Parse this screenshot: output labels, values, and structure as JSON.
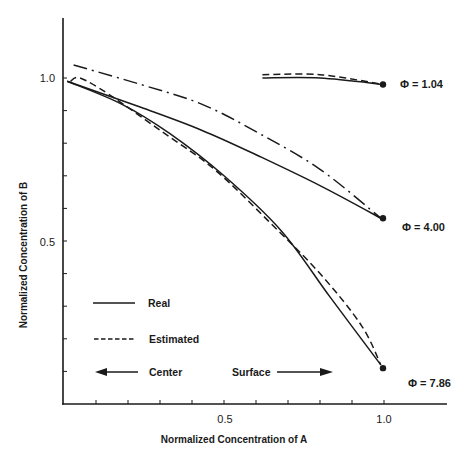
{
  "chart_data": {
    "type": "line",
    "title": "",
    "xlabel": "Normalized Concentration of A",
    "ylabel": "Normalized Concentration of B",
    "xlim": [
      0,
      1.2
    ],
    "ylim": [
      0,
      1.2
    ],
    "grid": false,
    "x_ticks": [
      0.1,
      0.2,
      0.3,
      0.4,
      0.5,
      0.6,
      0.7,
      0.8,
      0.9,
      1.0
    ],
    "x_tick_labels": {
      "0.5": "0.5",
      "1.0": "1.0"
    },
    "y_ticks": [
      0.1,
      0.2,
      0.3,
      0.4,
      0.5,
      0.6,
      0.7,
      0.8,
      0.9,
      1.0
    ],
    "y_tick_labels": {
      "0.5": "0.5",
      "1.0": "1.0"
    },
    "legend": [
      {
        "label": "Real",
        "style": "solid"
      },
      {
        "label": "Estimated",
        "style": "dashed"
      }
    ],
    "direction_annotations": [
      {
        "label": "Center",
        "arrow": "left"
      },
      {
        "label": "Surface",
        "arrow": "right"
      }
    ],
    "series": [
      {
        "name": "Real, Φ = 1.04",
        "group": "Φ = 1.04",
        "style": "solid",
        "x": [
          0.62,
          0.8,
          1.0
        ],
        "y": [
          1.0,
          1.0,
          0.98
        ]
      },
      {
        "name": "Estimated, Φ = 1.04",
        "group": "Φ = 1.04",
        "style": "dashed",
        "x": [
          0.62,
          0.8,
          1.0
        ],
        "y": [
          1.01,
          1.01,
          0.98
        ]
      },
      {
        "name": "Real, Φ = 4.00",
        "group": "Φ = 4.00",
        "style": "solid",
        "x": [
          0.01,
          0.24,
          0.43,
          0.61,
          0.8,
          0.99
        ],
        "y": [
          0.99,
          0.91,
          0.84,
          0.76,
          0.67,
          0.57
        ]
      },
      {
        "name": "Estimated, Φ = 4.00",
        "group": "Φ = 4.00",
        "style": "dashdot",
        "x": [
          0.03,
          0.24,
          0.43,
          0.61,
          0.8,
          0.99
        ],
        "y": [
          1.04,
          0.98,
          0.92,
          0.83,
          0.72,
          0.57
        ]
      },
      {
        "name": "Real, Φ = 7.86",
        "group": "Φ = 7.86",
        "style": "solid",
        "x": [
          0.01,
          0.18,
          0.33,
          0.5,
          0.68,
          0.83,
          0.99
        ],
        "y": [
          0.99,
          0.92,
          0.83,
          0.7,
          0.53,
          0.33,
          0.12
        ]
      },
      {
        "name": "Estimated, Φ = 7.86",
        "group": "Φ = 7.86",
        "style": "dashed",
        "x": [
          0.02,
          0.05,
          0.14,
          0.3,
          0.47,
          0.64,
          0.8,
          0.93,
          0.99
        ],
        "y": [
          0.99,
          1.0,
          0.95,
          0.84,
          0.72,
          0.56,
          0.4,
          0.24,
          0.12
        ]
      }
    ],
    "endpoint_markers": [
      {
        "x": 1.0,
        "y": 0.98,
        "label": "Φ = 1.04"
      },
      {
        "x": 1.0,
        "y": 0.57,
        "label": "Φ = 4.00"
      },
      {
        "x": 1.0,
        "y": 0.11,
        "label": "Φ = 7.86"
      }
    ]
  },
  "labels": {
    "xlabel": "Normalized Concentration of A",
    "ylabel": "Normalized Concentration of B",
    "x_tick_05": "0.5",
    "x_tick_10": "1.0",
    "y_tick_05": "0.5",
    "y_tick_10": "1.0",
    "legend_real": "Real",
    "legend_estimated": "Estimated",
    "center": "Center",
    "surface": "Surface",
    "phi_104": "Φ = 1.04",
    "phi_400": "Φ = 4.00",
    "phi_786": "Φ = 7.86"
  },
  "colors": {
    "ink": "#1a1a1a",
    "background": "#ffffff"
  }
}
